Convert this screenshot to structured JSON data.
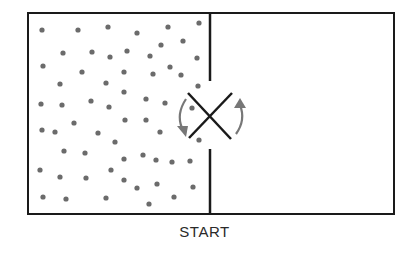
{
  "diagram": {
    "caption": "START",
    "colors": {
      "line": "#1a1a1a",
      "particle": "#6b6b6b",
      "arrow": "#777777",
      "background": "#ffffff"
    },
    "container": {
      "x": 28,
      "y": 13,
      "width": 366,
      "height": 201
    },
    "partition": {
      "x": 210,
      "top_end": 81,
      "bottom_start": 149
    },
    "valve": {
      "shape": "x-cross",
      "line1": [
        188,
        93,
        231,
        139
      ],
      "line2": [
        188,
        138,
        232,
        93
      ]
    },
    "arrows": [
      {
        "name": "rotate-arrow-left",
        "direction": "down"
      },
      {
        "name": "rotate-arrow-right",
        "direction": "up"
      }
    ],
    "left_chamber": "filled with gas particles",
    "right_chamber": "empty",
    "particles": [
      [
        42,
        30
      ],
      [
        78,
        30
      ],
      [
        108,
        27
      ],
      [
        137,
        33
      ],
      [
        168,
        27
      ],
      [
        199,
        23
      ],
      [
        63,
        53
      ],
      [
        92,
        52
      ],
      [
        110,
        57
      ],
      [
        127,
        51
      ],
      [
        150,
        56
      ],
      [
        161,
        45
      ],
      [
        183,
        41
      ],
      [
        43,
        66
      ],
      [
        82,
        72
      ],
      [
        124,
        72
      ],
      [
        153,
        74
      ],
      [
        170,
        67
      ],
      [
        181,
        75
      ],
      [
        197,
        58
      ],
      [
        60,
        84
      ],
      [
        106,
        83
      ],
      [
        124,
        92
      ],
      [
        198,
        86
      ],
      [
        41,
        104
      ],
      [
        62,
        105
      ],
      [
        91,
        101
      ],
      [
        109,
        107
      ],
      [
        146,
        99
      ],
      [
        165,
        103
      ],
      [
        192,
        108
      ],
      [
        42,
        130
      ],
      [
        55,
        132
      ],
      [
        74,
        123
      ],
      [
        98,
        133
      ],
      [
        115,
        142
      ],
      [
        125,
        120
      ],
      [
        146,
        120
      ],
      [
        160,
        132
      ],
      [
        199,
        140
      ],
      [
        64,
        151
      ],
      [
        85,
        153
      ],
      [
        124,
        159
      ],
      [
        143,
        155
      ],
      [
        156,
        160
      ],
      [
        172,
        162
      ],
      [
        190,
        161
      ],
      [
        40,
        170
      ],
      [
        60,
        177
      ],
      [
        86,
        178
      ],
      [
        111,
        170
      ],
      [
        124,
        180
      ],
      [
        137,
        188
      ],
      [
        157,
        184
      ],
      [
        193,
        187
      ],
      [
        43,
        197
      ],
      [
        66,
        199
      ],
      [
        106,
        198
      ],
      [
        149,
        204
      ],
      [
        174,
        197
      ]
    ]
  }
}
